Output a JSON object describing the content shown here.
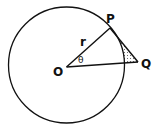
{
  "diagram": {
    "type": "geometry",
    "labels": {
      "P": "P",
      "Q": "Q",
      "O": "O",
      "r": "r",
      "theta": "θ"
    },
    "colors": {
      "stroke": "#111111",
      "background": "#ffffff",
      "shade": "#555555"
    }
  }
}
